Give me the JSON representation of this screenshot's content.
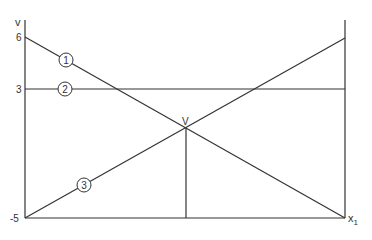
{
  "diagram": {
    "y_axis_label": "v",
    "x_axis_label": "x",
    "x_axis_subscript": "1",
    "intersection_label": "V",
    "ticks": [
      {
        "label": "6",
        "value": 6
      },
      {
        "label": "3",
        "value": 3
      },
      {
        "label": "-5",
        "value": -5
      }
    ],
    "lines": [
      {
        "id": "1",
        "label": "1",
        "description": "decreasing line from 6 at left to -5 at right"
      },
      {
        "id": "2",
        "label": "2",
        "description": "horizontal line at 3"
      },
      {
        "id": "3",
        "label": "3",
        "description": "increasing line from -5 at left to 6 at right"
      }
    ]
  }
}
